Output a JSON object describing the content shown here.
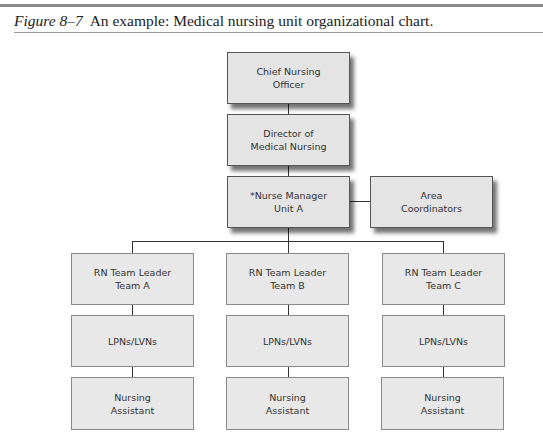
{
  "caption": {
    "figure_label": "Figure 8–7",
    "text": "An example: Medical nursing unit organizational chart."
  },
  "chart": {
    "top": {
      "cno": [
        "Chief Nursing",
        "Officer"
      ],
      "director": [
        "Director of",
        "Medical Nursing"
      ],
      "manager": [
        "*Nurse Manager",
        "Unit A"
      ],
      "coordinators": [
        "Area",
        "Coordinators"
      ]
    },
    "teams": [
      {
        "leader": [
          "RN Team Leader",
          "Team A"
        ],
        "lpn": "LPNs/LVNs",
        "assistant": [
          "Nursing",
          "Assistant"
        ]
      },
      {
        "leader": [
          "RN Team Leader",
          "Team B"
        ],
        "lpn": "LPNs/LVNs",
        "assistant": [
          "Nursing",
          "Assistant"
        ]
      },
      {
        "leader": [
          "RN Team Leader",
          "Team C"
        ],
        "lpn": "LPNs/LVNs",
        "assistant": [
          "Nursing",
          "Assistant"
        ]
      }
    ]
  }
}
